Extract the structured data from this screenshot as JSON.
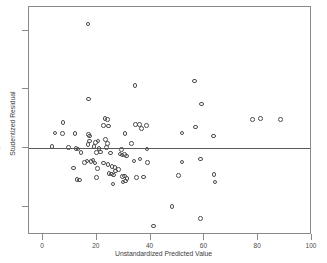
{
  "chart_data": {
    "type": "scatter",
    "title": "",
    "xlabel": "Unstandardized Predicted Value",
    "ylabel": "Studentized Residual",
    "xlim": [
      -5.2,
      100
    ],
    "ylim": [
      -2.95,
      4.8
    ],
    "xticks": [
      0,
      20,
      40,
      60,
      80,
      100
    ],
    "yticks": [
      -2,
      0,
      2,
      4
    ],
    "xtick_labels": [
      "0",
      "20",
      "40",
      "60",
      "80",
      "100"
    ],
    "ytick_labels": [
      "-2",
      "0",
      "2",
      "4"
    ],
    "grid": false,
    "legend": null,
    "reference_line": {
      "axis": "y",
      "value": 0
    },
    "marker": {
      "shape": "circle",
      "filled": false,
      "edge_color": "#4d4d4d",
      "size": 4.6
    },
    "frame_color": "#8a8a8a",
    "background": "#ffffff",
    "points": [
      [
        16.7,
        4.22
      ],
      [
        34.2,
        2.13
      ],
      [
        56.3,
        2.28
      ],
      [
        17.0,
        1.67
      ],
      [
        59.0,
        1.5
      ],
      [
        23.0,
        1.0
      ],
      [
        24.0,
        0.97
      ],
      [
        77.8,
        0.98
      ],
      [
        80.8,
        1.0
      ],
      [
        88.4,
        0.97
      ],
      [
        7.5,
        0.88
      ],
      [
        22.6,
        0.77
      ],
      [
        24.3,
        0.76
      ],
      [
        34.3,
        0.8
      ],
      [
        35.9,
        0.81
      ],
      [
        38.5,
        0.77
      ],
      [
        56.8,
        0.72
      ],
      [
        4.4,
        0.52
      ],
      [
        7.2,
        0.51
      ],
      [
        11.9,
        0.5
      ],
      [
        16.9,
        0.46
      ],
      [
        17.4,
        0.42
      ],
      [
        30.5,
        0.5
      ],
      [
        36.7,
        0.67
      ],
      [
        51.6,
        0.52
      ],
      [
        63.3,
        0.41
      ],
      [
        17.2,
        0.24
      ],
      [
        19.6,
        0.2
      ],
      [
        20.4,
        0.24
      ],
      [
        23.2,
        0.3
      ],
      [
        23.9,
        0.17
      ],
      [
        33.0,
        0.17
      ],
      [
        16.8,
        0.13
      ],
      [
        19.0,
        0.06
      ],
      [
        3.3,
        0.06
      ],
      [
        9.5,
        0.02
      ],
      [
        12.2,
        0.0
      ],
      [
        13.0,
        -0.02
      ],
      [
        20.8,
        -0.01
      ],
      [
        23.5,
        0.03
      ],
      [
        29.2,
        -0.05
      ],
      [
        38.7,
        -0.02
      ],
      [
        14.2,
        -0.14
      ],
      [
        20.0,
        -0.14
      ],
      [
        21.3,
        -0.13
      ],
      [
        25.0,
        -0.16
      ],
      [
        28.6,
        -0.2
      ],
      [
        29.4,
        -0.23
      ],
      [
        30.3,
        -0.22
      ],
      [
        31.0,
        -0.26
      ],
      [
        11.3,
        -0.67
      ],
      [
        15.5,
        -0.48
      ],
      [
        16.3,
        -0.44
      ],
      [
        17.9,
        -0.45
      ],
      [
        18.6,
        -0.4
      ],
      [
        19.3,
        -0.5
      ],
      [
        20.2,
        -0.69
      ],
      [
        22.4,
        -0.5
      ],
      [
        24.2,
        -0.55
      ],
      [
        25.6,
        -0.62
      ],
      [
        26.8,
        -0.65
      ],
      [
        28.1,
        -0.72
      ],
      [
        33.8,
        -0.43
      ],
      [
        36.0,
        -0.37
      ],
      [
        38.9,
        -0.48
      ],
      [
        51.7,
        -0.47
      ],
      [
        58.6,
        -0.37
      ],
      [
        12.6,
        -1.07
      ],
      [
        13.5,
        -1.08
      ],
      [
        19.9,
        -1.0
      ],
      [
        24.6,
        -0.85
      ],
      [
        25.4,
        -0.88
      ],
      [
        26.2,
        -0.91
      ],
      [
        26.9,
        -0.78
      ],
      [
        29.5,
        -0.97
      ],
      [
        30.2,
        -0.95
      ],
      [
        31.3,
        -1.02
      ],
      [
        34.8,
        -0.99
      ],
      [
        37.3,
        -0.98
      ],
      [
        26.0,
        -1.22
      ],
      [
        29.8,
        -1.15
      ],
      [
        30.6,
        -1.12
      ],
      [
        50.3,
        -0.92
      ],
      [
        63.5,
        -0.89
      ],
      [
        63.9,
        -1.15
      ],
      [
        47.9,
        -1.98
      ],
      [
        58.5,
        -2.39
      ],
      [
        41.0,
        -2.65
      ]
    ]
  }
}
